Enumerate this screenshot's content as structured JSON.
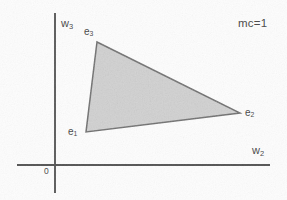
{
  "figure": {
    "background_color": "#fdfdfd",
    "annotation": "mc=1",
    "origin_label": "0"
  },
  "axes": {
    "y_axis_label": "w",
    "y_axis_sub": "3",
    "x_axis_label": "w",
    "x_axis_sub": "2",
    "axis_color": "#555555",
    "x_axis": {
      "x1": 17,
      "y1": 165,
      "x2": 270,
      "y2": 165
    },
    "y_axis": {
      "x1": 55,
      "y1": 13,
      "x2": 55,
      "y2": 193
    }
  },
  "region": {
    "name": "shaded-triangle",
    "fill_color": "#d2d2d2",
    "stroke_color": "#6a6a6a",
    "points": "97,42 240,113 86,132",
    "vertices": [
      {
        "id": "e1",
        "label": "e",
        "sub": "1",
        "x": 86,
        "y": 132
      },
      {
        "id": "e2",
        "label": "e",
        "sub": "2",
        "x": 240,
        "y": 113
      },
      {
        "id": "e3",
        "label": "e",
        "sub": "3",
        "x": 97,
        "y": 42
      }
    ]
  },
  "chart_data": {
    "type": "scatter",
    "title": "",
    "subtitle": "",
    "xlabel": "w2",
    "ylabel": "w3",
    "grid": false,
    "legend": "none",
    "annotations": [
      "mc=1",
      "0"
    ],
    "xlim": [
      17,
      270
    ],
    "ylim": [
      13,
      193
    ],
    "series": [
      {
        "name": "simplex region",
        "kind": "polygon",
        "fill": "#d2d2d2",
        "stroke": "#6a6a6a",
        "points": [
          {
            "label": "e1",
            "x": 86,
            "y": 132
          },
          {
            "label": "e2",
            "x": 240,
            "y": 113
          },
          {
            "label": "e3",
            "x": 97,
            "y": 42
          }
        ]
      }
    ]
  }
}
